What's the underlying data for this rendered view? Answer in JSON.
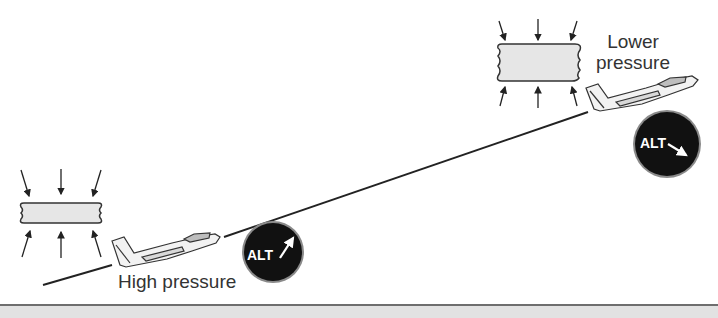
{
  "diagram": {
    "labels": {
      "high_pressure": "High pressure",
      "lower_pressure_line1": "Lower",
      "lower_pressure_line2": "pressure"
    },
    "altimeters": [
      {
        "id": "left",
        "text": "ALT",
        "needle": "pointing up-right (reading high)"
      },
      {
        "id": "right",
        "text": "ALT",
        "needle": "pointing down-right (reading low)"
      }
    ],
    "pressure_boxes": [
      {
        "id": "high",
        "shape": "flat compressed box"
      },
      {
        "id": "low",
        "shape": "tall expanded box"
      }
    ],
    "colors": {
      "dial_fill": "#111111",
      "dial_rim": "#8a8a8a",
      "box_fill": "#e6e6e6",
      "ground_fill": "#e2e2e2",
      "line": "#222222"
    }
  }
}
